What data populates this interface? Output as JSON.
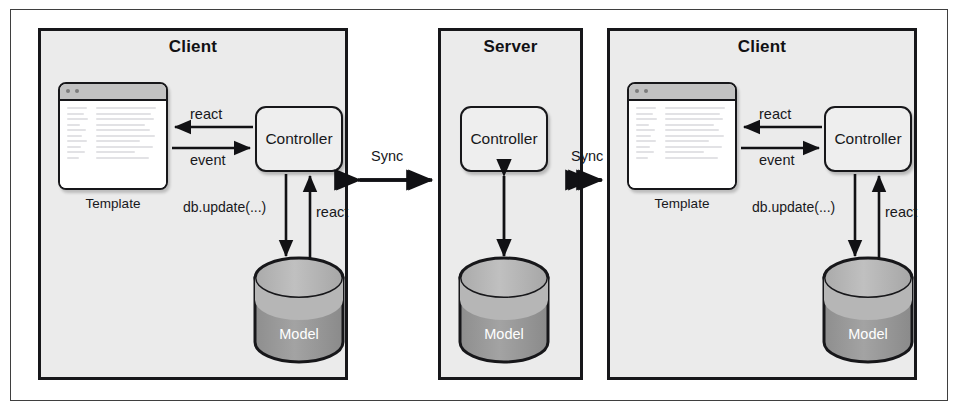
{
  "figure": {
    "type": "architecture-diagram"
  },
  "colors": {
    "panel_fill": "#ebebeb",
    "panel_border": "#17171a",
    "box_fill": "#eeeeee",
    "titlebar_fill": "#c2c2c2",
    "cylinder_top": "#b4b4b4",
    "cylinder_body": "#9a9a9a",
    "frame_border": "#3f3f3f",
    "page_background": "#ffffff"
  },
  "panels": [
    {
      "id": "client-left",
      "title": "Client",
      "template": {
        "caption": "Template",
        "icon": "browser-window-icon"
      },
      "controller": {
        "label": "Controller"
      },
      "model": {
        "label": "Model",
        "icon": "database-cylinder-icon"
      },
      "edges": [
        {
          "label": "react",
          "from": "controller",
          "to": "template",
          "direction": "left"
        },
        {
          "label": "event",
          "from": "template",
          "to": "controller",
          "direction": "right"
        },
        {
          "label": "db.update(...)",
          "from": "controller",
          "to": "model",
          "direction": "down"
        },
        {
          "label": "react",
          "from": "model",
          "to": "controller",
          "direction": "up"
        }
      ]
    },
    {
      "id": "server",
      "title": "Server",
      "controller": {
        "label": "Controller"
      },
      "model": {
        "label": "Model",
        "icon": "database-cylinder-icon"
      },
      "edges": [
        {
          "label": "",
          "from": "controller",
          "to": "model",
          "direction": "both-vertical"
        }
      ]
    },
    {
      "id": "client-right",
      "title": "Client",
      "template": {
        "caption": "Template",
        "icon": "browser-window-icon"
      },
      "controller": {
        "label": "Controller"
      },
      "model": {
        "label": "Model",
        "icon": "database-cylinder-icon"
      },
      "edges": [
        {
          "label": "react",
          "from": "controller",
          "to": "template",
          "direction": "left"
        },
        {
          "label": "event",
          "from": "template",
          "to": "controller",
          "direction": "right"
        },
        {
          "label": "db.update(...)",
          "from": "controller",
          "to": "model",
          "direction": "down"
        },
        {
          "label": "react",
          "from": "model",
          "to": "controller",
          "direction": "up"
        }
      ]
    }
  ],
  "connectors": [
    {
      "id": "sync-left",
      "label": "Sync",
      "between": [
        "client-left",
        "server"
      ],
      "direction": "bidirectional"
    },
    {
      "id": "sync-right",
      "label": "Sync",
      "between": [
        "server",
        "client-right"
      ],
      "direction": "bidirectional"
    }
  ]
}
